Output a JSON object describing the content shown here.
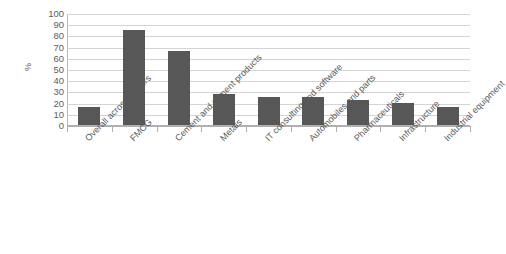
{
  "chart_data": {
    "type": "bar",
    "title": "",
    "subtitle": "",
    "xlabel": "",
    "ylabel": "%",
    "ylim": [
      0,
      100
    ],
    "ytick_step": 10,
    "yticks": [
      100,
      90,
      80,
      70,
      60,
      50,
      40,
      30,
      20,
      10,
      0
    ],
    "grid": true,
    "legend": "none",
    "bar_color": "#575757",
    "gridline_color": "#d4d4d4",
    "axis_color": "#b0b0b0",
    "categories": [
      "Overall across sectors",
      "FMCG",
      "Cement and cement products",
      "Metals",
      "IT consulting and software",
      "Automobiles and parts",
      "Pharmaceuticals",
      "Infrastructure",
      "Industrial equipment"
    ],
    "values": [
      16,
      85,
      66,
      28,
      25,
      25,
      22,
      20,
      16
    ]
  }
}
